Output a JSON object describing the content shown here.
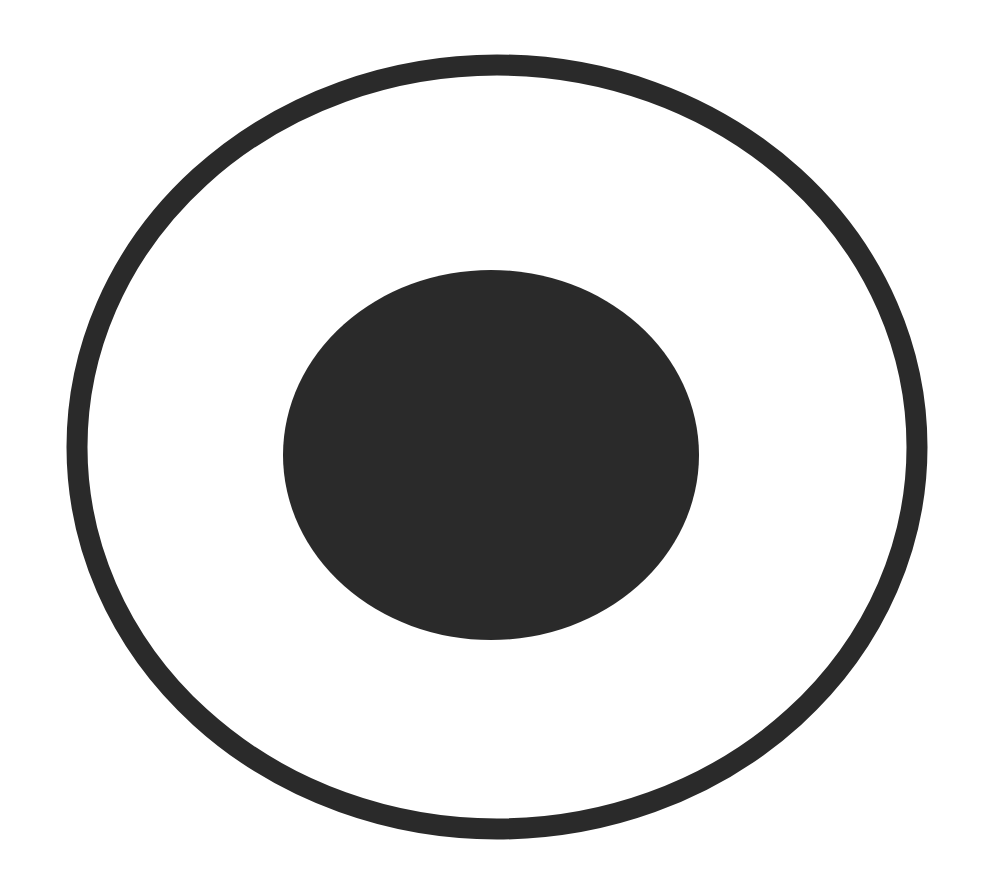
{
  "figure": {
    "background_color": "#ffffff",
    "ink_color": "#2a2a2a",
    "outer_ring": {
      "cx": 497,
      "cy": 447,
      "rx": 420,
      "ry": 382,
      "stroke_width": 21
    },
    "inner_disc": {
      "cx": 491,
      "cy": 455,
      "rx": 208,
      "ry": 185
    }
  }
}
